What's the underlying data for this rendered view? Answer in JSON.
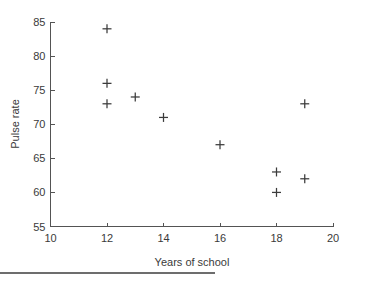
{
  "chart_data": {
    "type": "scatter",
    "title": "",
    "xlabel": "Years of school",
    "ylabel": "Pulse rate",
    "xlim": [
      10,
      20
    ],
    "ylim": [
      55,
      85
    ],
    "xticks": [
      10,
      12,
      14,
      16,
      18,
      20
    ],
    "yticks": [
      55,
      60,
      65,
      70,
      75,
      80,
      85
    ],
    "xtick_labels": [
      "10",
      "12",
      "14",
      "16",
      "18",
      "20"
    ],
    "ytick_labels": [
      "55",
      "60",
      "65",
      "70",
      "75",
      "80",
      "85"
    ],
    "grid": false,
    "legend": null,
    "marker": "+",
    "marker_color": "#3b3b3b",
    "axis_color": "#545454",
    "series": [
      {
        "name": "observations",
        "x": [
          12,
          12,
          12,
          13,
          14,
          16,
          18,
          18,
          19,
          19
        ],
        "y": [
          84,
          76,
          73,
          74,
          71,
          67,
          63,
          60,
          73,
          62
        ]
      }
    ],
    "points": [
      {
        "x": 12,
        "y": 84
      },
      {
        "x": 12,
        "y": 76
      },
      {
        "x": 12,
        "y": 73
      },
      {
        "x": 13,
        "y": 74
      },
      {
        "x": 14,
        "y": 71
      },
      {
        "x": 16,
        "y": 67
      },
      {
        "x": 19,
        "y": 73
      },
      {
        "x": 18,
        "y": 63
      },
      {
        "x": 19,
        "y": 62
      },
      {
        "x": 18,
        "y": 60
      }
    ]
  }
}
